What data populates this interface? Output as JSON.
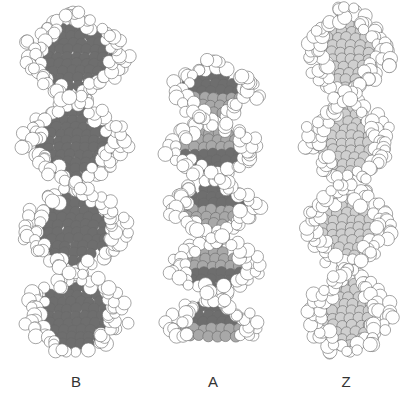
{
  "figure": {
    "colors": {
      "atom_fill": "#ffffff",
      "atom_stroke": "#6a6a6a",
      "groove_dark": "#6e6e6e",
      "groove_mid": "#a8a8a8",
      "groove_light": "#cfcfcf",
      "background": "#ffffff"
    },
    "helices": [
      {
        "id": "B",
        "label": "B",
        "x": 10,
        "y": 10,
        "w": 130,
        "h": 345,
        "turns": 2,
        "groove": "dark",
        "twist": 1.0
      },
      {
        "id": "A",
        "label": "A",
        "x": 158,
        "y": 58,
        "w": 110,
        "h": 285,
        "turns": 2.4,
        "groove": "mixed",
        "twist": 1.0
      },
      {
        "id": "Z",
        "label": "Z",
        "x": 298,
        "y": 5,
        "w": 100,
        "h": 355,
        "turns": 2,
        "groove": "light",
        "twist": -1.0
      }
    ],
    "labels": [
      {
        "text": "B",
        "x": 66
      },
      {
        "text": "A",
        "x": 203
      },
      {
        "text": "Z",
        "x": 336
      }
    ]
  }
}
